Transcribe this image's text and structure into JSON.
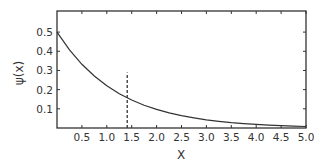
{
  "chart_data": {
    "type": "line",
    "title": "",
    "xlabel": "X",
    "ylabel": "ψ(x)",
    "xlim": [
      0,
      5.0
    ],
    "ylim": [
      0,
      0.61
    ],
    "grid": false,
    "legend": null,
    "x_ticks": [
      0.5,
      1.0,
      1.5,
      2.0,
      2.5,
      3.0,
      3.5,
      4.0,
      4.5,
      5.0
    ],
    "x_tick_labels": [
      "0.5",
      "1.0",
      "1.5",
      "2.0",
      "2.5",
      "3.0",
      "3.5",
      "4.0",
      "4.5",
      "5.0"
    ],
    "y_ticks": [
      0.1,
      0.2,
      0.3,
      0.4,
      0.5
    ],
    "y_tick_labels": [
      "0.1",
      "0.2",
      "0.3",
      "0.4",
      "0.5"
    ],
    "series": [
      {
        "name": "ψ(x)",
        "style": "solid",
        "x": [
          0,
          0.25,
          0.5,
          0.75,
          1.0,
          1.25,
          1.5,
          1.75,
          2.0,
          2.25,
          2.5,
          2.75,
          3.0,
          3.25,
          3.5,
          3.75,
          4.0,
          4.25,
          4.5,
          4.75,
          5.0
        ],
        "y": [
          0.5,
          0.407,
          0.332,
          0.271,
          0.22,
          0.179,
          0.146,
          0.119,
          0.097,
          0.079,
          0.064,
          0.053,
          0.043,
          0.035,
          0.028,
          0.023,
          0.019,
          0.015,
          0.012,
          0.01,
          0.008
        ]
      }
    ],
    "annotations": [
      {
        "type": "vertical-dashed-line",
        "x": 1.41,
        "y_from": 0,
        "y_to": 0.29
      }
    ]
  }
}
